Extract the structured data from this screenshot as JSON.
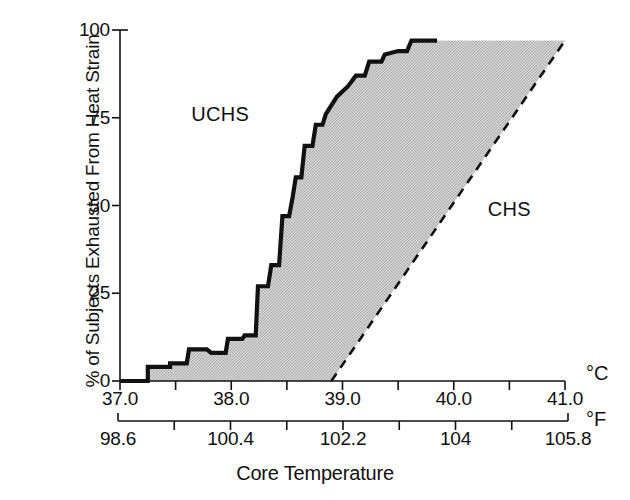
{
  "figure": {
    "x_axis_title": "Core Temperature",
    "y_axis_title": "% of Subjects Exhausted From Heat Strain",
    "unit_celsius": "°C",
    "unit_fahrenheit": "°F",
    "label_uchs": "UCHS",
    "label_chs": "CHS",
    "ink_color": "#111111",
    "shade_color": "#c8c8c8"
  },
  "chart_data": {
    "type": "area",
    "title": "",
    "subtitle": "",
    "xlabel": "Core Temperature",
    "ylabel": "% of Subjects Exhausted From Heat Strain",
    "xlim": [
      37.0,
      41.0
    ],
    "ylim": [
      0,
      100
    ],
    "grid": false,
    "legend": "none",
    "annotations": [
      {
        "text": "UCHS",
        "x": 37.9,
        "y": 76
      },
      {
        "text": "CHS",
        "x": 40.5,
        "y": 49
      }
    ],
    "axes": [
      {
        "name": "celsius",
        "unit": "°C",
        "ticks": [
          37.0,
          37.5,
          38.0,
          38.5,
          39.0,
          39.5,
          40.0,
          40.5,
          41.0
        ],
        "tick_labels": [
          "37.0",
          "",
          "38.0",
          "",
          "39.0",
          "",
          "40.0",
          "",
          "41.0"
        ]
      },
      {
        "name": "fahrenheit",
        "unit": "°F",
        "ticks": [
          98.6,
          99.5,
          100.4,
          101.3,
          102.2,
          103.1,
          104,
          104.9,
          105.8
        ],
        "tick_labels": [
          "98.6",
          "",
          "100.4",
          "",
          "102.2",
          "",
          "104",
          "",
          "105.8"
        ]
      }
    ],
    "yticks": [
      0,
      25,
      50,
      75,
      100
    ],
    "ytick_labels": [
      "0",
      "25",
      "50",
      "75",
      "100"
    ],
    "series": [
      {
        "name": "UCHS boundary (uncompensable heat strain) — stepped cumulative exhaustion curve",
        "style": "solid",
        "color": "#111111",
        "points": [
          [
            37.0,
            0
          ],
          [
            37.25,
            0
          ],
          [
            37.25,
            4
          ],
          [
            37.45,
            4
          ],
          [
            37.45,
            5
          ],
          [
            37.6,
            5
          ],
          [
            37.62,
            9
          ],
          [
            37.78,
            9
          ],
          [
            37.82,
            8
          ],
          [
            37.95,
            8
          ],
          [
            37.97,
            12
          ],
          [
            38.1,
            12
          ],
          [
            38.12,
            13
          ],
          [
            38.22,
            13
          ],
          [
            38.24,
            27
          ],
          [
            38.33,
            27
          ],
          [
            38.36,
            33
          ],
          [
            38.43,
            33
          ],
          [
            38.46,
            47
          ],
          [
            38.52,
            47
          ],
          [
            38.55,
            52
          ],
          [
            38.58,
            58
          ],
          [
            38.63,
            58
          ],
          [
            38.66,
            67
          ],
          [
            38.73,
            67
          ],
          [
            38.76,
            73
          ],
          [
            38.82,
            73
          ],
          [
            38.85,
            76
          ],
          [
            38.95,
            81
          ],
          [
            39.05,
            84
          ],
          [
            39.12,
            87
          ],
          [
            39.2,
            87
          ],
          [
            39.24,
            91
          ],
          [
            39.35,
            91
          ],
          [
            39.38,
            93
          ],
          [
            39.5,
            94
          ],
          [
            39.58,
            94
          ],
          [
            39.62,
            97
          ],
          [
            39.85,
            97
          ]
        ]
      },
      {
        "name": "CHS boundary (compensable heat strain) — linear threshold",
        "style": "dashed",
        "color": "#111111",
        "points": [
          [
            38.9,
            0
          ],
          [
            41.0,
            97
          ]
        ]
      }
    ],
    "shaded_region": {
      "name": "transition zone between UCHS and CHS boundaries",
      "fill": "#c8c8c8",
      "between": [
        "UCHS boundary (uncompensable heat strain) — stepped cumulative exhaustion curve",
        "CHS boundary (compensable heat strain) — linear threshold"
      ]
    }
  }
}
